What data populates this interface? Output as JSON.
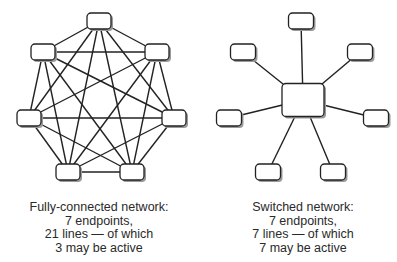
{
  "diagrams": [
    {
      "name": "fully-connected",
      "caption": [
        "Fully-connected network:",
        "7 endpoints,",
        "21 lines — of which",
        "3 may be active"
      ],
      "nodes": [
        [
          99,
          21
        ],
        [
          157,
          52
        ],
        [
          174,
          118
        ],
        [
          132,
          172
        ],
        [
          68,
          172
        ],
        [
          29,
          118
        ],
        [
          43,
          52
        ]
      ]
    },
    {
      "name": "switched",
      "caption": [
        "Switched network:",
        "7 endpoints,",
        "7 lines — of which",
        "7 may be active"
      ],
      "hub": [
        303,
        100
      ],
      "nodes": [
        [
          301,
          21
        ],
        [
          360,
          52
        ],
        [
          376,
          118
        ],
        [
          333,
          172
        ],
        [
          268,
          172
        ],
        [
          229,
          118
        ],
        [
          243,
          52
        ]
      ]
    }
  ],
  "colors": {
    "line": "#222222",
    "node_fill": "#ffffff",
    "shadow": "#9a9a9a",
    "text": "#2a2a2a"
  }
}
